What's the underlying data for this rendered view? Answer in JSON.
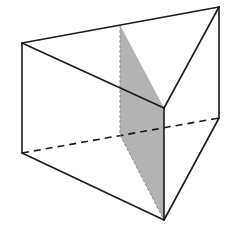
{
  "figure": {
    "type": "triangular-prism-with-cross-section",
    "colors": {
      "edge": "#1a1a1a",
      "section_fill": "#b3b3b3",
      "section_hidden_edge": "#8a8a8a",
      "background": "#ffffff"
    },
    "vertices": {
      "top_left": [
        22,
        43
      ],
      "top_back_right": [
        219,
        7
      ],
      "top_front": [
        164,
        108
      ],
      "top_cut": [
        120,
        25
      ],
      "bottom_left": [
        22,
        153
      ],
      "bottom_back_right": [
        219,
        118
      ],
      "bottom_front": [
        164,
        220
      ],
      "bottom_cut": [
        120,
        135
      ]
    },
    "visible_edges": [
      [
        "top_left",
        "top_back_right"
      ],
      [
        "top_left",
        "top_front"
      ],
      [
        "top_back_right",
        "top_front"
      ],
      [
        "top_left",
        "bottom_left"
      ],
      [
        "top_back_right",
        "bottom_back_right"
      ],
      [
        "top_front",
        "bottom_front"
      ],
      [
        "bottom_left",
        "bottom_front"
      ],
      [
        "bottom_back_right",
        "bottom_front"
      ]
    ],
    "hidden_edges": [
      [
        "bottom_left",
        "bottom_back_right"
      ]
    ],
    "shaded_section": [
      "top_cut",
      "top_front",
      "bottom_front",
      "bottom_cut"
    ]
  }
}
